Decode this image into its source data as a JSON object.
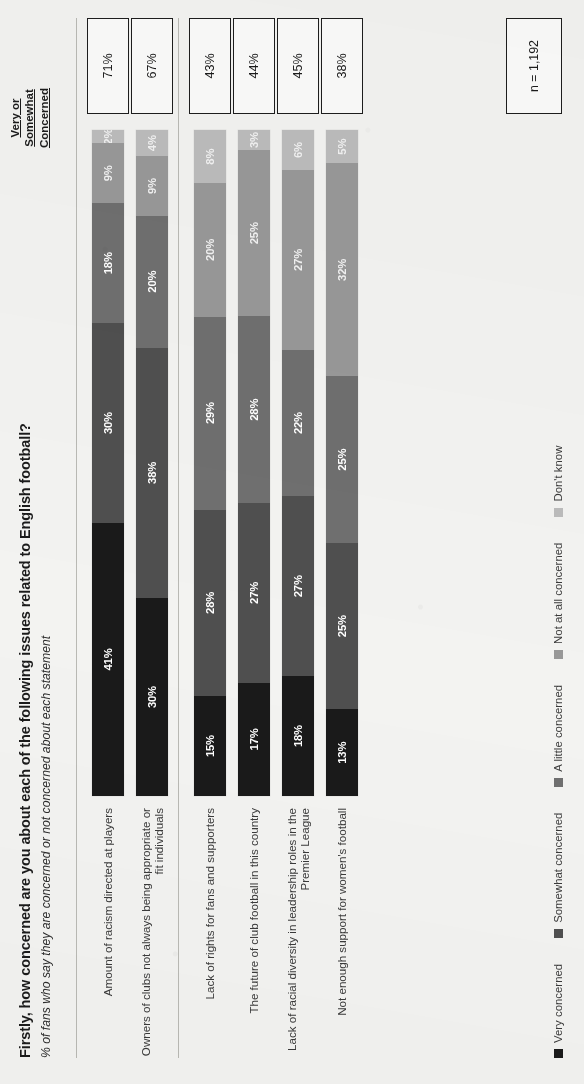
{
  "header": {
    "title": "Firstly, how concerned are you about each of the following issues related to English football?",
    "subtitle": "% of fans who say they are concerned or not concerned about each statement",
    "total_column_header_line1": "Very or",
    "total_column_header_line2": "Somewhat",
    "total_column_header_line3": "Concerned"
  },
  "footnote": {
    "sample_size": "n = 1,192"
  },
  "legend": [
    {
      "label": "Very concerned",
      "color": "#1a1a1a"
    },
    {
      "label": "Somewhat concerned",
      "color": "#4f4f4f"
    },
    {
      "label": "A little concerned",
      "color": "#6f6f6f"
    },
    {
      "label": "Not at all concerned",
      "color": "#989898"
    },
    {
      "label": "Don't know",
      "color": "#bcbcbc"
    }
  ],
  "chart_data": {
    "type": "bar",
    "title": "Firstly, how concerned are you about each of the following issues related to English football?",
    "subtitle": "% of fans who say they are concerned or not concerned about each statement",
    "orientation": "horizontal-stacked",
    "stacked": true,
    "xlabel": "",
    "ylabel": "",
    "xlim": [
      0,
      100
    ],
    "grid": false,
    "legend_position": "bottom",
    "units": "%",
    "categories": [
      "Amount of racism directed at players",
      "Owners of clubs not always being appropriate or fit individuals",
      "Lack of rights for fans and supporters",
      "The future of club football in this country",
      "Lack of racial diversity in leadership roles in the Premier League",
      "Not enough support for women's football"
    ],
    "series": [
      {
        "name": "Very concerned",
        "color": "#1a1a1a",
        "values": [
          41,
          30,
          15,
          17,
          18,
          13
        ]
      },
      {
        "name": "Somewhat concerned",
        "color": "#4f4f4f",
        "values": [
          30,
          38,
          28,
          27,
          27,
          25
        ]
      },
      {
        "name": "A little concerned",
        "color": "#6f6f6f",
        "values": [
          18,
          20,
          29,
          28,
          22,
          25
        ]
      },
      {
        "name": "Not at all concerned",
        "color": "#989898",
        "values": [
          9,
          9,
          20,
          25,
          27,
          32
        ]
      },
      {
        "name": "Don't know",
        "color": "#bcbcbc",
        "values": [
          2,
          4,
          8,
          3,
          6,
          5
        ]
      }
    ],
    "totals_label": "Very or Somewhat Concerned",
    "totals": [
      "71%",
      "67%",
      "43%",
      "44%",
      "45%",
      "38%"
    ],
    "annotation": "n = 1,192",
    "group_break_after_index": 1
  }
}
